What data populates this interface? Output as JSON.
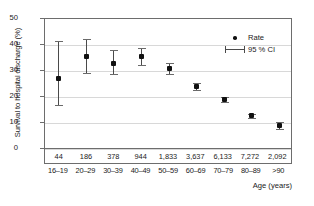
{
  "chart_data": {
    "type": "scatter",
    "title": "",
    "xlabel": "Age (years)",
    "ylabel": "Survival to hospital discharge (%)",
    "ylim": [
      0,
      50
    ],
    "yticks": [
      0,
      10,
      20,
      30,
      40,
      50
    ],
    "grid": true,
    "legend_position": "top-right",
    "categories": [
      "16–19",
      "20–29",
      "30–39",
      "40–49",
      "50–59",
      "60–69",
      "70–79",
      "80–89",
      ">90"
    ],
    "counts": [
      "44",
      "186",
      "378",
      "944",
      "1,833",
      "3,637",
      "6,133",
      "7,272",
      "2,092"
    ],
    "series": [
      {
        "name": "Rate",
        "values": [
          27.3,
          35.5,
          33.0,
          35.5,
          30.8,
          23.9,
          18.9,
          12.8,
          9.0
        ],
        "ci_low": [
          17.0,
          29.2,
          28.7,
          32.4,
          28.8,
          22.6,
          17.9,
          12.0,
          7.8
        ],
        "ci_high": [
          41.7,
          42.3,
          38.1,
          39.0,
          33.0,
          25.3,
          19.9,
          13.6,
          10.2
        ]
      }
    ],
    "legend": [
      {
        "label": "Rate",
        "glyph": "dot-marker"
      },
      {
        "label": "95 % CI",
        "glyph": "error-bar-marker"
      }
    ],
    "colors": {
      "marker": "#111111",
      "error_bar": "#4a4a4a",
      "grid": "#d8d8d8",
      "axis": "#6d6d6d",
      "background": "#ffffff"
    }
  }
}
